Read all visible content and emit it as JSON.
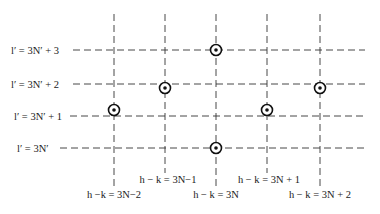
{
  "diagram": {
    "row_labels": [
      {
        "id": "row-3",
        "text": "l′ = 3N′ + 3"
      },
      {
        "id": "row-2",
        "text": "l′ = 3N′ + 2"
      },
      {
        "id": "row-1",
        "text": "l′ = 3N′ + 1"
      },
      {
        "id": "row-0",
        "text": "l′ = 3N′"
      }
    ],
    "column_labels": [
      {
        "id": "col-m2",
        "text": "h −k = 3N−2"
      },
      {
        "id": "col-m1",
        "text": "h − k = 3N−1"
      },
      {
        "id": "col-0",
        "text": "h − k = 3N"
      },
      {
        "id": "col-p1",
        "text": "h − k = 3N + 1"
      },
      {
        "id": "col-p2",
        "text": "h − k = 3N + 2"
      }
    ],
    "points": [
      {
        "col": 2,
        "row": 3
      },
      {
        "col": 1,
        "row": 2
      },
      {
        "col": 4,
        "row": 2
      },
      {
        "col": 0,
        "row": 1
      },
      {
        "col": 3,
        "row": 1
      },
      {
        "col": 2,
        "row": 0
      }
    ]
  }
}
